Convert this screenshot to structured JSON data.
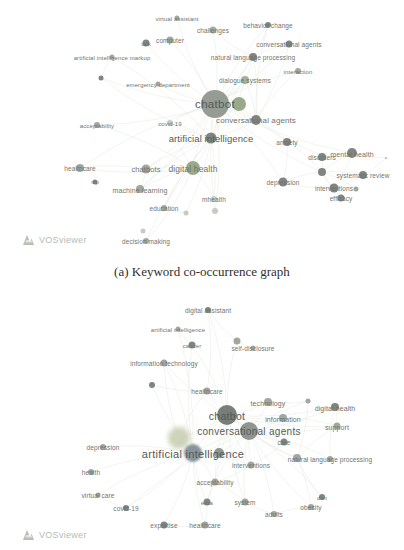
{
  "figure": {
    "caption_a": "(a) Keyword co-occurrence graph"
  },
  "watermark": {
    "label": "VOSviewer"
  },
  "colors": {
    "edge": "#dde4d6",
    "label": "#6f746f",
    "label_big": "#565b56",
    "green": "#9caa90",
    "green2": "#90a27f",
    "gray": "#989e98",
    "dark": "#757b76",
    "light": "#c2c8bc",
    "olive": "#8b948a",
    "charcoal": "#6d736f",
    "midgray": "#868c87",
    "blue": "#7f8c96",
    "lime": "#c9cfb4"
  },
  "chart_data": [
    {
      "type": "network",
      "name": "keyword-co-occurrence-graph-a",
      "width": 404,
      "height": 258,
      "nodes": [
        {
          "label": "virtual assistant",
          "x": 177,
          "y": 18,
          "r": 2.5,
          "c": "gray",
          "fs": 6
        },
        {
          "label": "challenges",
          "x": 213,
          "y": 30,
          "r": 3.5,
          "c": "green",
          "fs": 6.5
        },
        {
          "label": "behavior change",
          "x": 268,
          "y": 25,
          "r": 3,
          "c": "dark",
          "fs": 6.5
        },
        {
          "label": "computer",
          "x": 170,
          "y": 40,
          "r": 3.5,
          "c": "gray",
          "fs": 6.5
        },
        {
          "label": "talk",
          "x": 146,
          "y": 43,
          "r": 3.5,
          "c": "dark",
          "fs": 6
        },
        {
          "label": "conversational agents",
          "x": 289,
          "y": 44,
          "r": 3.5,
          "c": "dark",
          "fs": 6.5
        },
        {
          "label": "artificial intelligence markup",
          "x": 112,
          "y": 57,
          "r": 2.5,
          "c": "gray",
          "fs": 6
        },
        {
          "label": "natural language processing",
          "x": 253,
          "y": 57,
          "r": 4,
          "c": "dark",
          "fs": 6.5
        },
        {
          "label": "interaction",
          "x": 298,
          "y": 71,
          "r": 3,
          "c": "gray",
          "fs": 6
        },
        {
          "label": "",
          "x": 101,
          "y": 78,
          "r": 2.5,
          "c": "dark"
        },
        {
          "label": "emergency department",
          "x": 158,
          "y": 84,
          "r": 2.5,
          "c": "gray",
          "fs": 6
        },
        {
          "label": "dialogue systems",
          "x": 245,
          "y": 80,
          "r": 4,
          "c": "green",
          "fs": 6.5
        },
        {
          "label": "chatbot",
          "x": 215,
          "y": 104,
          "r": 14,
          "c": "olive",
          "fs": 11.5
        },
        {
          "label": "",
          "x": 239,
          "y": 104,
          "r": 7,
          "c": "green2"
        },
        {
          "label": "acceptability",
          "x": 97,
          "y": 125,
          "r": 3,
          "c": "gray",
          "fs": 6
        },
        {
          "label": "covid-19",
          "x": 170,
          "y": 123,
          "r": 3,
          "c": "light",
          "fs": 6
        },
        {
          "label": "conversational agents",
          "x": 256,
          "y": 120,
          "r": 5,
          "c": "dark",
          "fs": 8
        },
        {
          "label": "artificial intelligence",
          "x": 211,
          "y": 138,
          "r": 5.5,
          "c": "dark",
          "fs": 9.5
        },
        {
          "label": "anxiety",
          "x": 287,
          "y": 142,
          "r": 4,
          "c": "dark",
          "fs": 6.5
        },
        {
          "label": "digital health",
          "x": 193,
          "y": 168,
          "r": 7,
          "c": "green2",
          "fs": 8.5
        },
        {
          "label": "disorders",
          "x": 322,
          "y": 157,
          "r": 4,
          "c": "dark",
          "fs": 6.5
        },
        {
          "label": "mental health",
          "x": 352,
          "y": 153,
          "r": 5,
          "c": "dark",
          "fs": 7
        },
        {
          "label": "",
          "x": 386,
          "y": 158,
          "r": 1.3,
          "c": "light"
        },
        {
          "label": "healthcare",
          "x": 80,
          "y": 168,
          "r": 4,
          "c": "gray",
          "fs": 6.5
        },
        {
          "label": "chatbots",
          "x": 146,
          "y": 169,
          "r": 4.5,
          "c": "gray",
          "fs": 7.5
        },
        {
          "label": "nlp",
          "x": 95,
          "y": 182,
          "r": 2.5,
          "c": "dark",
          "fs": 5.5
        },
        {
          "label": "machine learning",
          "x": 140,
          "y": 189,
          "r": 4,
          "c": "gray",
          "fs": 7
        },
        {
          "label": "",
          "x": 322,
          "y": 172,
          "r": 4,
          "c": "dark"
        },
        {
          "label": "efficacy",
          "x": 341,
          "y": 198,
          "r": 3.5,
          "c": "dark",
          "fs": 6.5
        },
        {
          "label": "systematic review",
          "x": 363,
          "y": 175,
          "r": 4,
          "c": "dark",
          "fs": 6.5
        },
        {
          "label": "interventions",
          "x": 334,
          "y": 188,
          "r": 4.5,
          "c": "dark",
          "fs": 6.5
        },
        {
          "label": "",
          "x": 356,
          "y": 189,
          "r": 2.5,
          "c": "gray"
        },
        {
          "label": "depression",
          "x": 283,
          "y": 182,
          "r": 4.5,
          "c": "dark",
          "fs": 6.5
        },
        {
          "label": "mhealth",
          "x": 214,
          "y": 199,
          "r": 3,
          "c": "light",
          "fs": 6.5
        },
        {
          "label": "education",
          "x": 164,
          "y": 208,
          "r": 3,
          "c": "gray",
          "fs": 6.5
        },
        {
          "label": "",
          "x": 186,
          "y": 213,
          "r": 2.5,
          "c": "light"
        },
        {
          "label": "",
          "x": 215,
          "y": 211,
          "r": 3,
          "c": "light"
        },
        {
          "label": "",
          "x": 143,
          "y": 231,
          "r": 2.5,
          "c": "light"
        },
        {
          "label": "decision making",
          "x": 146,
          "y": 241,
          "r": 3,
          "c": "gray",
          "fs": 6.5
        }
      ],
      "edges": [
        [
          12,
          0
        ],
        [
          12,
          1
        ],
        [
          12,
          2
        ],
        [
          12,
          3
        ],
        [
          12,
          4
        ],
        [
          12,
          5
        ],
        [
          12,
          7
        ],
        [
          12,
          8
        ],
        [
          12,
          10
        ],
        [
          12,
          11
        ],
        [
          12,
          13
        ],
        [
          12,
          14
        ],
        [
          12,
          15
        ],
        [
          12,
          16
        ],
        [
          12,
          17
        ],
        [
          12,
          18
        ],
        [
          12,
          19
        ],
        [
          12,
          21
        ],
        [
          12,
          23
        ],
        [
          12,
          24
        ],
        [
          12,
          26
        ],
        [
          12,
          27
        ],
        [
          12,
          32
        ],
        [
          12,
          33
        ],
        [
          12,
          36
        ],
        [
          17,
          6
        ],
        [
          17,
          7
        ],
        [
          17,
          9
        ],
        [
          17,
          11
        ],
        [
          17,
          13
        ],
        [
          17,
          15
        ],
        [
          17,
          16
        ],
        [
          17,
          19
        ],
        [
          17,
          24
        ],
        [
          17,
          26
        ],
        [
          17,
          33
        ],
        [
          17,
          34
        ],
        [
          17,
          35
        ],
        [
          17,
          38
        ],
        [
          16,
          5
        ],
        [
          16,
          7
        ],
        [
          16,
          8
        ],
        [
          16,
          11
        ],
        [
          16,
          18
        ],
        [
          16,
          2
        ],
        [
          19,
          14
        ],
        [
          19,
          15
        ],
        [
          19,
          23
        ],
        [
          19,
          24
        ],
        [
          19,
          26
        ],
        [
          19,
          33
        ],
        [
          19,
          34
        ],
        [
          27,
          20
        ],
        [
          27,
          21
        ],
        [
          27,
          28
        ],
        [
          27,
          29
        ],
        [
          27,
          30
        ],
        [
          27,
          32
        ],
        [
          27,
          18
        ],
        [
          27,
          31
        ],
        [
          30,
          21
        ],
        [
          30,
          28
        ],
        [
          30,
          29
        ],
        [
          30,
          32
        ],
        [
          18,
          20
        ],
        [
          18,
          32
        ],
        [
          7,
          1
        ],
        [
          7,
          2
        ],
        [
          7,
          5
        ],
        [
          7,
          11
        ],
        [
          9,
          12
        ],
        [
          6,
          9
        ],
        [
          21,
          22
        ],
        [
          29,
          22
        ],
        [
          13,
          16
        ],
        [
          13,
          11
        ],
        [
          24,
          26
        ],
        [
          24,
          23
        ],
        [
          34,
          35
        ],
        [
          33,
          36
        ],
        [
          38,
          19
        ]
      ]
    },
    {
      "type": "network",
      "name": "keyword-co-occurrence-graph-b",
      "width": 404,
      "height": 255,
      "nodes": [
        {
          "label": "digital assistant",
          "x": 208,
          "y": 15,
          "r": 3,
          "c": "dark",
          "fs": 6.5
        },
        {
          "label": "artificial intelligence",
          "x": 178,
          "y": 34,
          "r": 2.5,
          "c": "gray",
          "fs": 6
        },
        {
          "label": "cancer",
          "x": 192,
          "y": 50,
          "r": 3.5,
          "c": "dark",
          "fs": 6
        },
        {
          "label": "",
          "x": 237,
          "y": 46,
          "r": 3.5,
          "c": "gray"
        },
        {
          "label": "self-disclosure",
          "x": 253,
          "y": 53,
          "r": 2.5,
          "c": "gray",
          "fs": 6.5
        },
        {
          "label": "information technology",
          "x": 164,
          "y": 68,
          "r": 3.5,
          "c": "gray",
          "fs": 6.5
        },
        {
          "label": "",
          "x": 152,
          "y": 90,
          "r": 3,
          "c": "dark"
        },
        {
          "label": "healthcare",
          "x": 207,
          "y": 96,
          "r": 3.5,
          "c": "gray",
          "fs": 6.5
        },
        {
          "label": "technology",
          "x": 268,
          "y": 107,
          "r": 4,
          "c": "gray",
          "fs": 7
        },
        {
          "label": "",
          "x": 308,
          "y": 106,
          "r": 2.5,
          "c": "gray"
        },
        {
          "label": "digital health",
          "x": 335,
          "y": 112,
          "r": 4,
          "c": "dark",
          "fs": 7
        },
        {
          "label": "chatbot",
          "x": 227,
          "y": 120,
          "r": 10,
          "c": "charcoal",
          "fs": 10.5
        },
        {
          "label": "information",
          "x": 283,
          "y": 123,
          "r": 4,
          "c": "gray",
          "fs": 7
        },
        {
          "label": "",
          "x": 179,
          "y": 143,
          "r": 11,
          "c": "lime",
          "blur": 2.5
        },
        {
          "label": "support",
          "x": 337,
          "y": 131,
          "r": 3.5,
          "c": "gray",
          "fs": 7
        },
        {
          "label": "conversational agents",
          "x": 249,
          "y": 136,
          "r": 9,
          "c": "midgray",
          "fs": 10
        },
        {
          "label": "care",
          "x": 284,
          "y": 147,
          "r": 3.5,
          "c": "dark",
          "fs": 6.5
        },
        {
          "label": "depression",
          "x": 103,
          "y": 152,
          "r": 3,
          "c": "gray",
          "fs": 6.5
        },
        {
          "label": "artificial intelligence",
          "x": 193,
          "y": 158,
          "r": 9,
          "c": "blue",
          "fs": 11,
          "blur": 1
        },
        {
          "label": "",
          "x": 219,
          "y": 158,
          "r": 5,
          "c": "midgray"
        },
        {
          "label": "",
          "x": 297,
          "y": 163,
          "r": 4,
          "c": "gray"
        },
        {
          "label": "natural language processing",
          "x": 330,
          "y": 164,
          "r": 3,
          "c": "gray",
          "fs": 6.5
        },
        {
          "label": "interventions",
          "x": 251,
          "y": 170,
          "r": 3.5,
          "c": "gray",
          "fs": 6.5
        },
        {
          "label": "health",
          "x": 91,
          "y": 177,
          "r": 3,
          "c": "gray",
          "fs": 6.5
        },
        {
          "label": "acceptability",
          "x": 215,
          "y": 187,
          "r": 3.5,
          "c": "gray",
          "fs": 6.5
        },
        {
          "label": "virtual care",
          "x": 98,
          "y": 200,
          "r": 2.5,
          "c": "gray",
          "fs": 6.5
        },
        {
          "label": "covid-19",
          "x": 126,
          "y": 213,
          "r": 3,
          "c": "dark",
          "fs": 6.5
        },
        {
          "label": "ema",
          "x": 207,
          "y": 207,
          "r": 3.5,
          "c": "dark",
          "fs": 6
        },
        {
          "label": "system",
          "x": 245,
          "y": 207,
          "r": 3.5,
          "c": "gray",
          "fs": 6.5
        },
        {
          "label": "diet",
          "x": 322,
          "y": 202,
          "r": 3,
          "c": "dark",
          "fs": 6
        },
        {
          "label": "obesity",
          "x": 311,
          "y": 212,
          "r": 3,
          "c": "gray",
          "fs": 6.5
        },
        {
          "label": "adults",
          "x": 274,
          "y": 219,
          "r": 3,
          "c": "gray",
          "fs": 6.5
        },
        {
          "label": "expertise",
          "x": 164,
          "y": 230,
          "r": 3.5,
          "c": "dark",
          "fs": 6.5
        },
        {
          "label": "healthcare",
          "x": 205,
          "y": 230,
          "r": 3.5,
          "c": "gray",
          "fs": 6.5
        }
      ],
      "edges": [
        [
          11,
          0
        ],
        [
          11,
          2
        ],
        [
          11,
          3
        ],
        [
          11,
          5
        ],
        [
          11,
          7
        ],
        [
          11,
          8
        ],
        [
          11,
          10
        ],
        [
          11,
          12
        ],
        [
          11,
          13
        ],
        [
          11,
          14
        ],
        [
          11,
          15
        ],
        [
          11,
          16
        ],
        [
          11,
          18
        ],
        [
          11,
          20
        ],
        [
          11,
          22
        ],
        [
          11,
          24
        ],
        [
          11,
          27
        ],
        [
          11,
          28
        ],
        [
          15,
          8
        ],
        [
          15,
          9
        ],
        [
          15,
          10
        ],
        [
          15,
          12
        ],
        [
          15,
          14
        ],
        [
          15,
          16
        ],
        [
          15,
          18
        ],
        [
          15,
          19
        ],
        [
          15,
          20
        ],
        [
          15,
          21
        ],
        [
          15,
          22
        ],
        [
          15,
          24
        ],
        [
          15,
          26
        ],
        [
          15,
          28
        ],
        [
          15,
          29
        ],
        [
          15,
          30
        ],
        [
          15,
          31
        ],
        [
          18,
          1
        ],
        [
          18,
          2
        ],
        [
          18,
          5
        ],
        [
          18,
          6
        ],
        [
          18,
          13
        ],
        [
          18,
          17
        ],
        [
          18,
          19
        ],
        [
          18,
          22
        ],
        [
          18,
          23
        ],
        [
          18,
          24
        ],
        [
          18,
          25
        ],
        [
          18,
          26
        ],
        [
          18,
          27
        ],
        [
          18,
          32
        ],
        [
          18,
          33
        ],
        [
          20,
          9
        ],
        [
          20,
          14
        ],
        [
          20,
          21
        ],
        [
          20,
          29
        ],
        [
          20,
          30
        ],
        [
          22,
          24
        ],
        [
          24,
          27
        ],
        [
          24,
          28
        ],
        [
          28,
          31
        ],
        [
          29,
          30
        ],
        [
          8,
          9
        ],
        [
          0,
          3
        ],
        [
          1,
          2
        ],
        [
          3,
          4
        ],
        [
          6,
          7
        ],
        [
          12,
          14
        ],
        [
          10,
          14
        ],
        [
          25,
          26
        ],
        [
          27,
          33
        ],
        [
          32,
          33
        ],
        [
          13,
          5
        ],
        [
          13,
          7
        ],
        [
          7,
          0
        ],
        [
          12,
          16
        ],
        [
          16,
          22
        ],
        [
          10,
          21
        ],
        [
          30,
          31
        ]
      ]
    }
  ]
}
